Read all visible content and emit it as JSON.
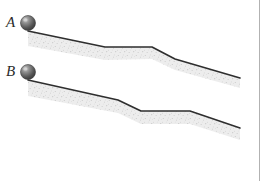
{
  "figure": {
    "background_color": "#ffffff",
    "gutter_rule_color": "#b2b2b2",
    "surface_line_color": "#2e2e2e",
    "ground_fill_color": "#ededed",
    "stipple_dot_color": "#9a9a9a",
    "ball_color": "#4a4a4a",
    "ball_highlight_color": "#c9c9c9",
    "ball_radius": 7.5
  },
  "ramps": [
    {
      "id": "A",
      "label": "A",
      "label_x": 6,
      "label_y": 15,
      "ball": {
        "cx": 28,
        "cy": 23,
        "r": 7.5
      },
      "surface_points": "28,31 105,47 152,47 175,59 240,78",
      "ground_polygon": "28,31 105,47 152,47 175,59 240,78 240,88 175,70 152,59 105,60 28,46",
      "segments": [
        {
          "name": "upper-incline",
          "from_x": 28,
          "from_y": 31,
          "to_x": 105,
          "to_y": 47,
          "kind": "downhill"
        },
        {
          "name": "plateau",
          "from_x": 105,
          "from_y": 47,
          "to_x": 152,
          "to_y": 47,
          "kind": "flat"
        },
        {
          "name": "steep-drop",
          "from_x": 152,
          "from_y": 47,
          "to_x": 175,
          "to_y": 59,
          "kind": "downhill-steep"
        },
        {
          "name": "lower-incline",
          "from_x": 175,
          "from_y": 59,
          "to_x": 240,
          "to_y": 78,
          "kind": "downhill"
        }
      ]
    },
    {
      "id": "B",
      "label": "B",
      "label_x": 6,
      "label_y": 64,
      "ball": {
        "cx": 28,
        "cy": 72,
        "r": 7.5
      },
      "surface_points": "28,80 118,100 141,111 190,111 240,128",
      "ground_polygon": "28,80 118,100 141,111 190,111 240,128 240,140 190,124 141,124 118,113 28,96",
      "segments": [
        {
          "name": "upper-incline",
          "from_x": 28,
          "from_y": 80,
          "to_x": 118,
          "to_y": 100,
          "kind": "downhill"
        },
        {
          "name": "steep-drop",
          "from_x": 118,
          "from_y": 100,
          "to_x": 141,
          "to_y": 111,
          "kind": "downhill-steep"
        },
        {
          "name": "plateau",
          "from_x": 141,
          "from_y": 111,
          "to_x": 190,
          "to_y": 111,
          "kind": "flat"
        },
        {
          "name": "lower-incline",
          "from_x": 190,
          "from_y": 111,
          "to_x": 240,
          "to_y": 128,
          "kind": "downhill"
        }
      ]
    }
  ]
}
